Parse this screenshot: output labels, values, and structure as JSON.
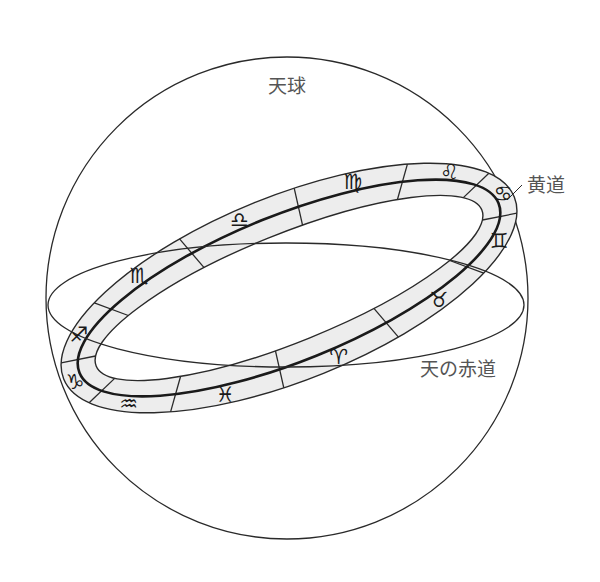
{
  "diagram": {
    "labels": {
      "celestial_sphere": "天球",
      "ecliptic": "黄道",
      "celestial_equator": "天の赤道"
    },
    "colors": {
      "line": "#2a2a2a",
      "band_fill": "#ededed",
      "label_text": "#555555",
      "background": "#ffffff"
    },
    "zodiac_signs": [
      {
        "name": "aries",
        "glyph": "♈"
      },
      {
        "name": "taurus",
        "glyph": "♉"
      },
      {
        "name": "gemini",
        "glyph": "♊"
      },
      {
        "name": "cancer",
        "glyph": "♋"
      },
      {
        "name": "leo",
        "glyph": "♌"
      },
      {
        "name": "virgo",
        "glyph": "♍"
      },
      {
        "name": "libra",
        "glyph": "♎"
      },
      {
        "name": "scorpio",
        "glyph": "♏"
      },
      {
        "name": "sagittarius",
        "glyph": "♐"
      },
      {
        "name": "capricorn",
        "glyph": "♑"
      },
      {
        "name": "aquarius",
        "glyph": "♒"
      },
      {
        "name": "pisces",
        "glyph": "♓"
      }
    ]
  }
}
